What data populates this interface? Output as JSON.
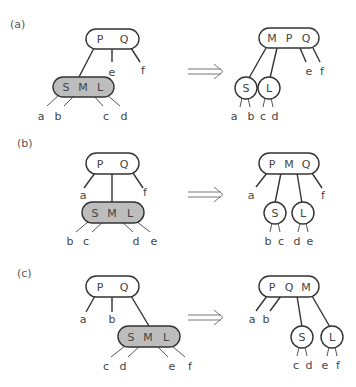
{
  "panels": [
    {
      "label": "(a)",
      "before": {
        "parent": [
          "P",
          "Q"
        ],
        "split_node": [
          "S",
          "M",
          "L"
        ],
        "leaves": [
          "a",
          "b",
          "c",
          "d",
          "e",
          "f"
        ]
      },
      "after": {
        "parent": [
          "M",
          "P",
          "Q"
        ],
        "children": [
          "S",
          "L"
        ],
        "leaves": [
          "a",
          "b",
          "c",
          "d",
          "e",
          "f"
        ]
      }
    },
    {
      "label": "(b)",
      "before": {
        "parent": [
          "P",
          "Q"
        ],
        "split_node": [
          "S",
          "M",
          "L"
        ],
        "leaves": [
          "a",
          "b",
          "c",
          "d",
          "e",
          "f"
        ]
      },
      "after": {
        "parent": [
          "P",
          "M",
          "Q"
        ],
        "children": [
          "S",
          "L"
        ],
        "leaves": [
          "a",
          "b",
          "c",
          "d",
          "e",
          "f"
        ]
      }
    },
    {
      "label": "(c)",
      "before": {
        "parent": [
          "P",
          "Q"
        ],
        "split_node": [
          "S",
          "M",
          "L"
        ],
        "leaves": [
          "a",
          "b",
          "c",
          "d",
          "e",
          "f"
        ]
      },
      "after": {
        "parent": [
          "P",
          "Q",
          "M"
        ],
        "children": [
          "S",
          "L"
        ],
        "leaves": [
          "a",
          "b",
          "c",
          "d",
          "e",
          "f"
        ]
      }
    }
  ],
  "arrow_symbol": "⟹",
  "colors": {
    "split_node_fill": "#bdbdbd",
    "stroke": "#333333",
    "text": "#444444"
  }
}
